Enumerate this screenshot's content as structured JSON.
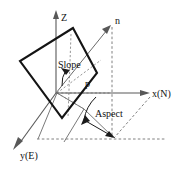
{
  "figure": {
    "background_color": "#ffffff",
    "line_color": "#141414",
    "axis_color": "#585858",
    "dash_color": "#808080",
    "labels": {
      "z_axis": "Z",
      "x_axis": "x(N)",
      "y_axis": "y(E)",
      "normal": "n",
      "slope": "Slope",
      "slope_symbol": "p",
      "aspect": "Aspect"
    },
    "geometry": {
      "origin": [
        56,
        93
      ],
      "z_axis_tip": [
        56,
        12
      ],
      "x_axis_tip": [
        150,
        93
      ],
      "y_axis_tip": [
        13,
        149
      ],
      "normal_tip": [
        110,
        26
      ],
      "plane_corners": [
        [
          73,
          28
        ],
        [
          20,
          61
        ],
        [
          62,
          118
        ],
        [
          97,
          73
        ]
      ],
      "projection_point": [
        113,
        138
      ],
      "vertical_guide_x": 112,
      "horizontal_guide_y": 139
    }
  }
}
